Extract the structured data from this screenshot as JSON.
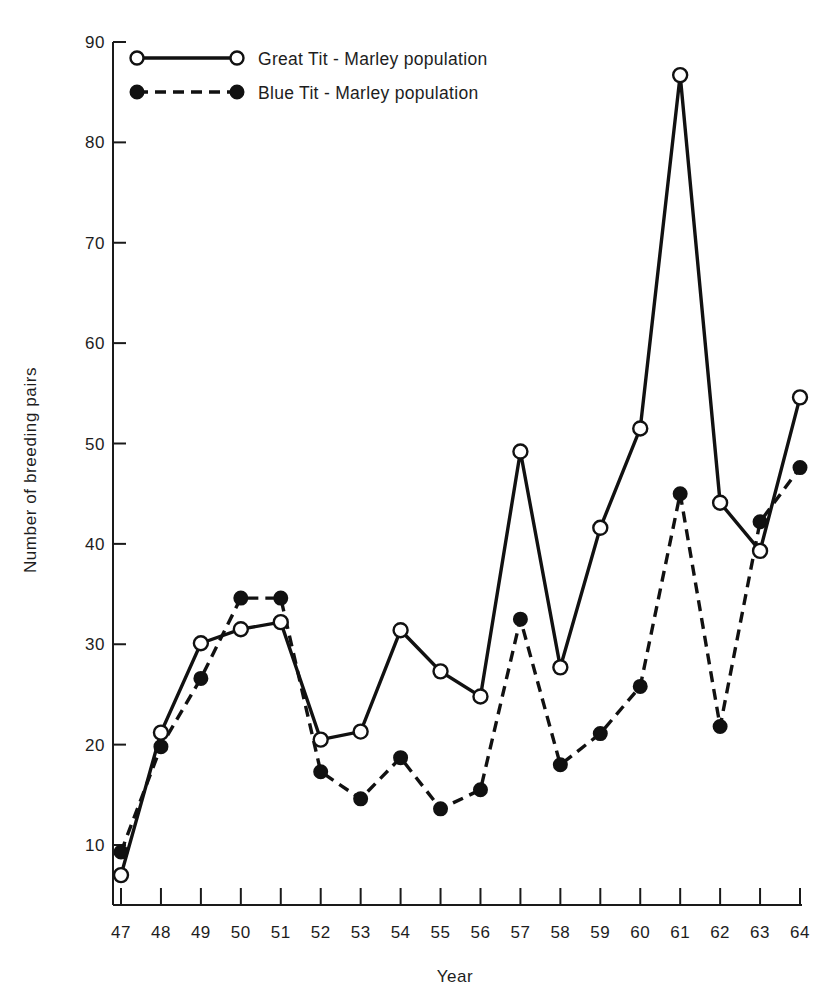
{
  "figure": {
    "title": "",
    "background_color": "#ffffff",
    "ink_color": "#111111"
  },
  "axes": {
    "x_label": "Year",
    "y_label": "Number of breeding pairs",
    "x_tick_labels": [
      "47",
      "48",
      "49",
      "50",
      "51",
      "52",
      "53",
      "54",
      "55",
      "56",
      "57",
      "58",
      "59",
      "60",
      "61",
      "62",
      "63",
      "64"
    ],
    "y_tick_labels": [
      "10",
      "20",
      "30",
      "40",
      "50",
      "60",
      "70",
      "80",
      "90"
    ]
  },
  "legend": {
    "entries": [
      {
        "label": "Great Tit - Marley population",
        "marker": "open-circle",
        "line": "solid"
      },
      {
        "label": "Blue Tit - Marley population",
        "marker": "filled-circle",
        "line": "dashed"
      }
    ]
  },
  "chart_data": {
    "type": "line",
    "title": "",
    "xlabel": "Year",
    "ylabel": "Number of breeding pairs",
    "x": [
      47,
      48,
      49,
      50,
      51,
      52,
      53,
      54,
      55,
      56,
      57,
      58,
      59,
      60,
      61,
      62,
      63,
      64
    ],
    "xlim": [
      47,
      64
    ],
    "ylim": [
      0,
      90
    ],
    "y_ticks": [
      10,
      20,
      30,
      40,
      50,
      60,
      70,
      80,
      90
    ],
    "grid": false,
    "legend_position": "top-left",
    "series": [
      {
        "name": "Great Tit - Marley population",
        "marker": "open-circle",
        "line": "solid",
        "values": [
          7.0,
          21.2,
          30.1,
          31.5,
          32.2,
          20.5,
          21.3,
          31.4,
          27.3,
          24.8,
          49.2,
          27.7,
          41.6,
          51.5,
          86.7,
          44.1,
          39.3,
          54.6
        ]
      },
      {
        "name": "Blue Tit - Marley population",
        "marker": "filled-circle",
        "line": "dashed",
        "values": [
          9.3,
          19.8,
          26.6,
          34.6,
          34.6,
          17.3,
          14.6,
          18.7,
          13.6,
          15.5,
          32.5,
          18.0,
          21.1,
          25.8,
          45.0,
          21.8,
          42.2,
          47.6
        ]
      }
    ]
  }
}
